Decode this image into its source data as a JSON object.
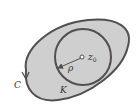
{
  "diagram": {
    "type": "complex-analysis-contour",
    "colors": {
      "region_fill": "#cfcfcf",
      "stroke": "#505050",
      "background": "#ffffff",
      "text": "#333333"
    },
    "outer_contour": {
      "label": "C",
      "orientation": "counterclockwise"
    },
    "circle": {
      "label": "K",
      "center_label": "z",
      "center_subscript": "0",
      "radius_label": "ρ"
    }
  }
}
